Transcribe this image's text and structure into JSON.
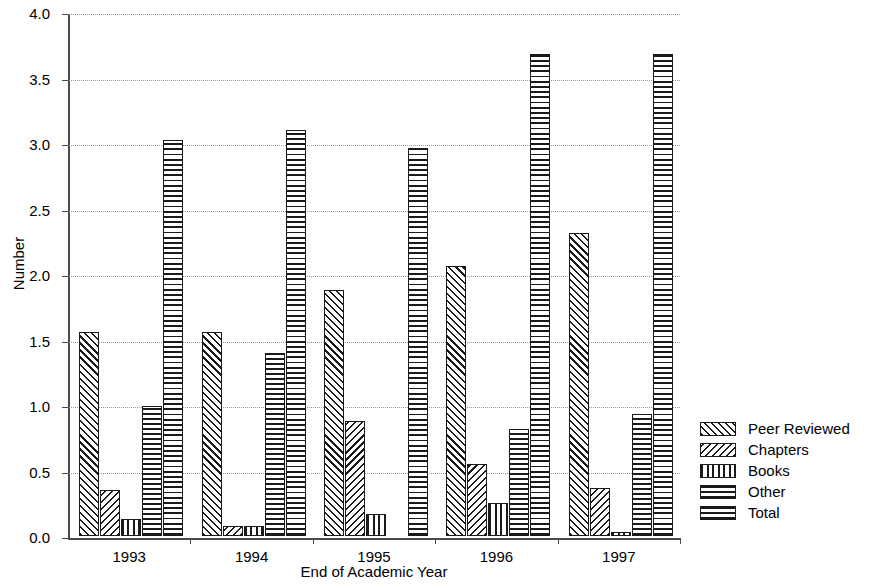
{
  "chart_data": {
    "type": "bar",
    "title": "",
    "xlabel": "End of Academic Year",
    "ylabel": "Number",
    "categories": [
      "1993",
      "1994",
      "1995",
      "1996",
      "1997"
    ],
    "series": [
      {
        "name": "Peer Reviewed",
        "pattern": "diagonal-forward",
        "values": [
          1.56,
          1.56,
          1.88,
          2.06,
          2.31
        ]
      },
      {
        "name": "Chapters",
        "pattern": "diagonal-backward",
        "values": [
          0.35,
          0.08,
          0.88,
          0.55,
          0.37
        ]
      },
      {
        "name": "Books",
        "pattern": "vertical-lines",
        "values": [
          0.13,
          0.08,
          0.17,
          0.25,
          0.03
        ]
      },
      {
        "name": "Other",
        "pattern": "horizontal-lines",
        "values": [
          0.99,
          1.4,
          0.0,
          0.82,
          0.93
        ]
      },
      {
        "name": "Total",
        "pattern": "cross-hatch",
        "values": [
          3.02,
          3.1,
          2.96,
          3.68,
          3.68
        ]
      }
    ],
    "ylim": [
      0.0,
      4.0
    ],
    "yticks": [
      "0.0",
      "0.5",
      "1.0",
      "1.5",
      "2.0",
      "2.5",
      "3.0",
      "3.5",
      "4.0"
    ],
    "ytick_values": [
      0.0,
      0.5,
      1.0,
      1.5,
      2.0,
      2.5,
      3.0,
      3.5,
      4.0
    ],
    "grid": true,
    "grid_style": "dotted",
    "legend_position": "right",
    "colors": {
      "ink": "#1a1a1a",
      "axis": "#4a4a4a",
      "grid": "#9a9a9a",
      "background": "#ffffff"
    }
  },
  "legend": {
    "entries": [
      {
        "label": "Peer Reviewed"
      },
      {
        "label": "Chapters"
      },
      {
        "label": "Books"
      },
      {
        "label": "Other"
      },
      {
        "label": "Total"
      }
    ]
  }
}
